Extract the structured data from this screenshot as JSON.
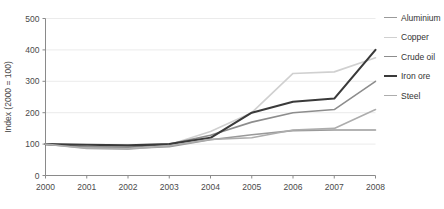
{
  "chart_data": {
    "type": "line",
    "title": "",
    "xlabel": "",
    "ylabel": "Index (2000 = 100)",
    "x": [
      2000,
      2001,
      2002,
      2003,
      2004,
      2005,
      2006,
      2007,
      2008
    ],
    "xticklabels": [
      "2000",
      "2001",
      "2002",
      "2003",
      "2004",
      "2005",
      "2006",
      "2007",
      "2008"
    ],
    "yticks": [
      0,
      100,
      200,
      300,
      400,
      500
    ],
    "yticklabels": [
      "0",
      "100",
      "200",
      "300",
      "400",
      "500"
    ],
    "ylim": [
      0,
      500
    ],
    "xlim": [
      2000,
      2008
    ],
    "grid": true,
    "legend_position": "right",
    "series": [
      {
        "name": "Aluminium",
        "color": "#9a9a9a",
        "width": 1.6,
        "values": [
          100,
          88,
          86,
          92,
          114,
          130,
          143,
          145,
          145
        ]
      },
      {
        "name": "Copper",
        "color": "#d0d0d0",
        "width": 1.6,
        "values": [
          100,
          90,
          88,
          98,
          140,
          200,
          325,
          330,
          375
        ]
      },
      {
        "name": "Crude oil",
        "color": "#8d8d8d",
        "width": 1.6,
        "values": [
          100,
          92,
          90,
          100,
          128,
          170,
          200,
          210,
          300
        ]
      },
      {
        "name": "Iron ore",
        "color": "#3a3a3a",
        "width": 2.1,
        "values": [
          100,
          98,
          96,
          100,
          120,
          200,
          235,
          245,
          400
        ]
      },
      {
        "name": "Steel",
        "color": "#adadad",
        "width": 1.6,
        "values": [
          100,
          86,
          84,
          95,
          115,
          120,
          145,
          150,
          210
        ]
      }
    ]
  },
  "legend": {
    "items": [
      {
        "label": "Aluminium"
      },
      {
        "label": "Copper"
      },
      {
        "label": "Crude oil"
      },
      {
        "label": "Iron ore"
      },
      {
        "label": "Steel"
      }
    ]
  },
  "colors": {
    "axis": "#8a8a8a",
    "grid": "#ebebeb",
    "text": "#4a4a4a",
    "background": "#ffffff"
  }
}
